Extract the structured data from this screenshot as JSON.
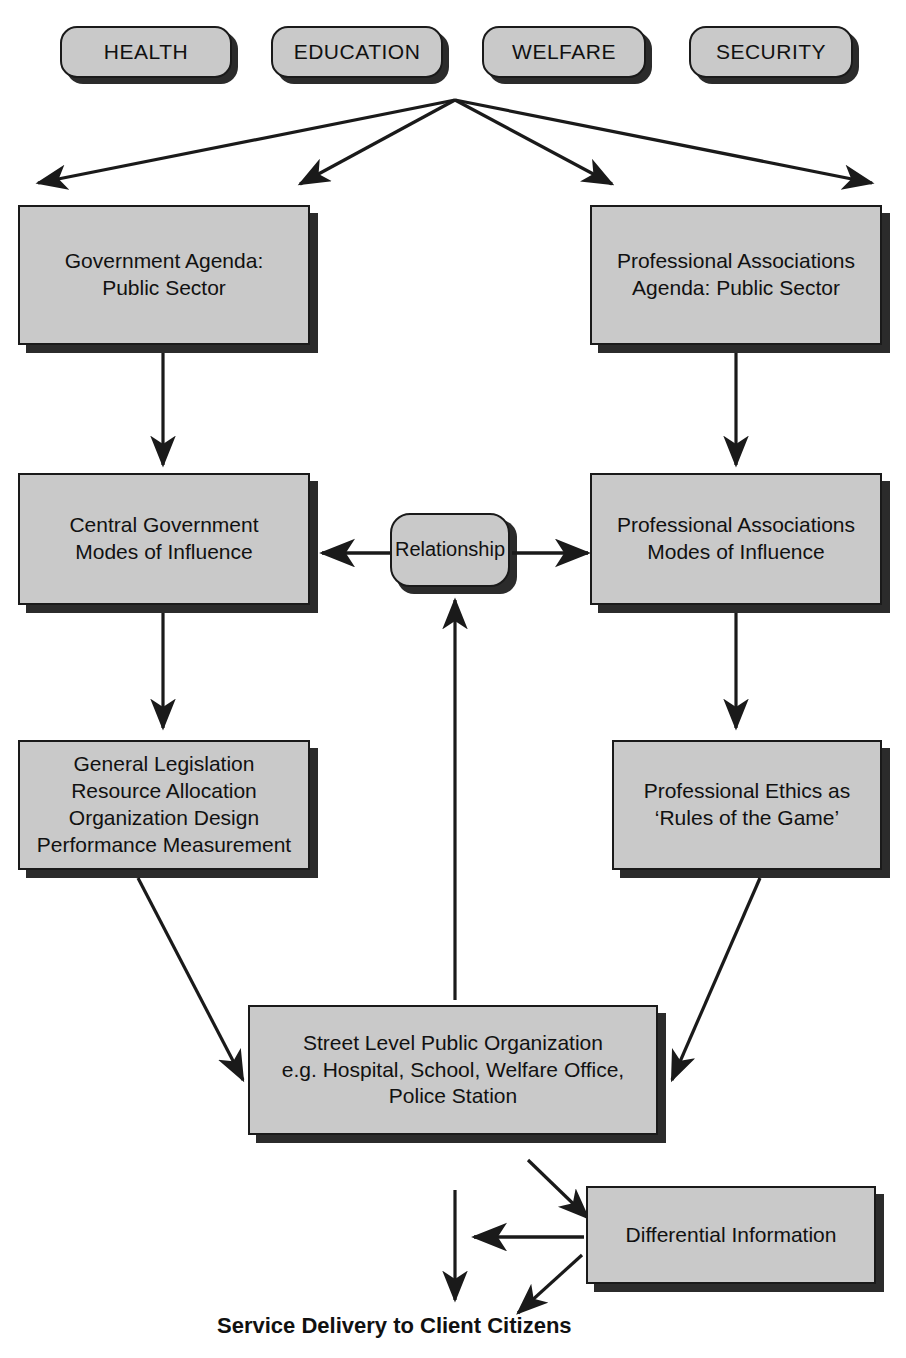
{
  "diagram": {
    "colors": {
      "node_fill": "#c9c9c9",
      "node_border": "#1a1a1a",
      "shadow": "#2b2b2b",
      "text": "#111111",
      "background": "#ffffff"
    },
    "sector_pills": [
      {
        "label": "HEALTH"
      },
      {
        "label": "EDUCATION"
      },
      {
        "label": "WELFARE"
      },
      {
        "label": "SECURITY"
      }
    ],
    "nodes": {
      "government_agenda": {
        "label": "Government Agenda:\nPublic Sector"
      },
      "professional_associations_agenda": {
        "label": "Professional Associations\nAgenda: Public Sector"
      },
      "central_government_modes": {
        "label": "Central Government\nModes of Influence"
      },
      "relationship": {
        "label": "Relationship"
      },
      "professional_associations_modes": {
        "label": "Professional Associations\nModes of Influence"
      },
      "government_instruments": {
        "label": "General Legislation\nResource Allocation\nOrganization Design\nPerformance Measurement"
      },
      "professional_ethics": {
        "label": "Professional Ethics as\n‘Rules of the Game’"
      },
      "street_level_organization": {
        "label": "Street Level Public Organization\ne.g. Hospital, School, Welfare Office,\nPolice Station"
      },
      "differential_information": {
        "label": "Differential Information"
      }
    },
    "caption": {
      "service_delivery": "Service Delivery to Client Citizens"
    }
  }
}
